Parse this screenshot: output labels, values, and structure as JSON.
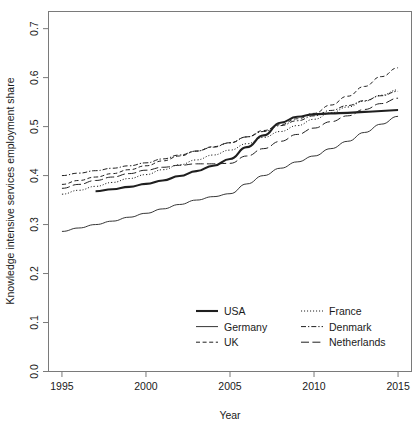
{
  "chart_data": {
    "type": "line",
    "title": "",
    "xlabel": "Year",
    "ylabel": "Knowledge intensive services employment share",
    "xlim": [
      1994.2,
      2015.8
    ],
    "ylim": [
      0.0,
      0.735
    ],
    "grid": false,
    "legend_position": "bottom-center",
    "xticks": [
      1995,
      2000,
      2005,
      2010,
      2015
    ],
    "xtick_labels": [
      "1995",
      "2000",
      "2005",
      "2010",
      "2015"
    ],
    "yticks": [
      0.0,
      0.1,
      0.2,
      0.3,
      0.4,
      0.5,
      0.6,
      0.7
    ],
    "ytick_labels": [
      "0.0",
      "0.1",
      "0.2",
      "0.3",
      "0.4",
      "0.5",
      "0.6",
      "0.7"
    ],
    "series": [
      {
        "name": "USA",
        "style": "solid",
        "width": 2.1,
        "dash": "none",
        "color": "#1f1f1f",
        "x": [
          1997,
          1998,
          1999,
          2000,
          2001,
          2002,
          2003,
          2004,
          2005,
          2006,
          2007,
          2008,
          2009,
          2010,
          2011,
          2012,
          2013,
          2014,
          2015
        ],
        "y": [
          0.368,
          0.372,
          0.377,
          0.383,
          0.39,
          0.399,
          0.409,
          0.42,
          0.434,
          0.458,
          0.482,
          0.508,
          0.52,
          0.525,
          0.527,
          0.528,
          0.53,
          0.532,
          0.534
        ]
      },
      {
        "name": "Germany",
        "style": "solid",
        "width": 0.9,
        "dash": "none",
        "color": "#1f1f1f",
        "x": [
          1995,
          1996,
          1997,
          1998,
          1999,
          2000,
          2001,
          2002,
          2003,
          2004,
          2005,
          2006,
          2007,
          2008,
          2009,
          2010,
          2011,
          2012,
          2013,
          2014,
          2015
        ],
        "y": [
          0.286,
          0.293,
          0.3,
          0.307,
          0.315,
          0.323,
          0.332,
          0.341,
          0.35,
          0.357,
          0.363,
          0.383,
          0.4,
          0.415,
          0.428,
          0.44,
          0.455,
          0.47,
          0.488,
          0.505,
          0.521
        ]
      },
      {
        "name": "UK",
        "style": "dashed",
        "width": 1.0,
        "dash": "4,2.6",
        "color": "#1f1f1f",
        "x": [
          1995,
          1996,
          1997,
          1998,
          1999,
          2000,
          2001,
          2002,
          2003,
          2004,
          2005,
          2006,
          2007,
          2008,
          2009,
          2010,
          2011,
          2012,
          2013,
          2014,
          2015
        ],
        "y": [
          0.382,
          0.39,
          0.397,
          0.404,
          0.412,
          0.42,
          0.43,
          0.44,
          0.45,
          0.459,
          0.467,
          0.479,
          0.492,
          0.504,
          0.516,
          0.527,
          0.544,
          0.562,
          0.582,
          0.602,
          0.62
        ]
      },
      {
        "name": "France",
        "style": "dotted",
        "width": 1.0,
        "dash": "1.1,1.9",
        "color": "#1f1f1f",
        "x": [
          1995,
          1996,
          1997,
          1998,
          1999,
          2000,
          2001,
          2002,
          2003,
          2004,
          2005,
          2006,
          2007,
          2008,
          2009,
          2010,
          2011,
          2012,
          2013,
          2014,
          2015
        ],
        "y": [
          0.362,
          0.37,
          0.378,
          0.386,
          0.394,
          0.402,
          0.412,
          0.422,
          0.432,
          0.442,
          0.452,
          0.465,
          0.478,
          0.49,
          0.502,
          0.515,
          0.528,
          0.54,
          0.552,
          0.564,
          0.575
        ]
      },
      {
        "name": "Denmark",
        "style": "dashdot",
        "width": 1.0,
        "dash": "5,2,1.3,2",
        "color": "#1f1f1f",
        "x": [
          1995,
          1996,
          1997,
          1998,
          1999,
          2000,
          2001,
          2002,
          2003,
          2004,
          2005,
          2006,
          2007,
          2008,
          2009,
          2010,
          2011,
          2012,
          2013,
          2014,
          2015
        ],
        "y": [
          0.4,
          0.405,
          0.41,
          0.415,
          0.42,
          0.426,
          0.434,
          0.442,
          0.45,
          0.458,
          0.467,
          0.479,
          0.49,
          0.502,
          0.512,
          0.522,
          0.533,
          0.543,
          0.553,
          0.563,
          0.572
        ]
      },
      {
        "name": "Netherlands",
        "style": "longdash",
        "width": 1.0,
        "dash": "8,3.4",
        "color": "#1f1f1f",
        "x": [
          1995,
          1996,
          1997,
          1998,
          1999,
          2000,
          2001,
          2002,
          2003,
          2004,
          2005,
          2006,
          2007,
          2008,
          2009,
          2010,
          2011,
          2012,
          2013,
          2014,
          2015
        ],
        "y": [
          0.374,
          0.382,
          0.39,
          0.397,
          0.404,
          0.411,
          0.417,
          0.421,
          0.424,
          0.424,
          0.425,
          0.44,
          0.455,
          0.47,
          0.484,
          0.497,
          0.51,
          0.522,
          0.535,
          0.547,
          0.558
        ]
      }
    ],
    "legend": {
      "entries": [
        {
          "label": "USA",
          "style": "solid",
          "column": 0
        },
        {
          "label": "Germany",
          "style": "solid-thin",
          "column": 0
        },
        {
          "label": "UK",
          "style": "dashed",
          "column": 0
        },
        {
          "label": "France",
          "style": "dotted",
          "column": 1
        },
        {
          "label": "Denmark",
          "style": "dashdot",
          "column": 1
        },
        {
          "label": "Netherlands",
          "style": "longdash",
          "column": 1
        }
      ]
    }
  }
}
